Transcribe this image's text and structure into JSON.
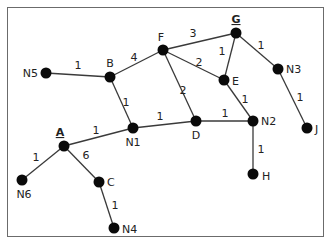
{
  "graph": {
    "nodes": [
      {
        "id": "N5",
        "label": "N5",
        "emphasis": false
      },
      {
        "id": "B",
        "label": "B",
        "emphasis": false
      },
      {
        "id": "F",
        "label": "F",
        "emphasis": false
      },
      {
        "id": "G",
        "label": "G",
        "emphasis": true
      },
      {
        "id": "E",
        "label": "E",
        "emphasis": false
      },
      {
        "id": "N3",
        "label": "N3",
        "emphasis": false
      },
      {
        "id": "J",
        "label": "J",
        "emphasis": false
      },
      {
        "id": "N1",
        "label": "N1",
        "emphasis": false
      },
      {
        "id": "D",
        "label": "D",
        "emphasis": false
      },
      {
        "id": "N2",
        "label": "N2",
        "emphasis": false
      },
      {
        "id": "H",
        "label": "H",
        "emphasis": false
      },
      {
        "id": "A",
        "label": "A",
        "emphasis": true
      },
      {
        "id": "N6",
        "label": "N6",
        "emphasis": false
      },
      {
        "id": "C",
        "label": "C",
        "emphasis": false
      },
      {
        "id": "N4",
        "label": "N4",
        "emphasis": false
      }
    ],
    "edges": [
      {
        "from": "N5",
        "to": "B",
        "weight": "1"
      },
      {
        "from": "B",
        "to": "F",
        "weight": "4"
      },
      {
        "from": "B",
        "to": "N1",
        "weight": "1"
      },
      {
        "from": "F",
        "to": "G",
        "weight": "3"
      },
      {
        "from": "F",
        "to": "E",
        "weight": "2"
      },
      {
        "from": "F",
        "to": "D",
        "weight": "2"
      },
      {
        "from": "G",
        "to": "E",
        "weight": "1"
      },
      {
        "from": "G",
        "to": "N3",
        "weight": "1"
      },
      {
        "from": "N3",
        "to": "J",
        "weight": "1"
      },
      {
        "from": "E",
        "to": "N2",
        "weight": "1"
      },
      {
        "from": "A",
        "to": "N1",
        "weight": "1"
      },
      {
        "from": "N1",
        "to": "D",
        "weight": "1"
      },
      {
        "from": "D",
        "to": "N2",
        "weight": "1"
      },
      {
        "from": "N2",
        "to": "H",
        "weight": "1"
      },
      {
        "from": "A",
        "to": "N6",
        "weight": "1"
      },
      {
        "from": "A",
        "to": "C",
        "weight": "6"
      },
      {
        "from": "C",
        "to": "N4",
        "weight": "1"
      }
    ]
  }
}
